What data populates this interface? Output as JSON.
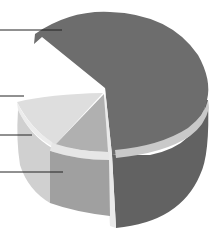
{
  "diagram": {
    "type": "3d-layered-cylinder-cutaway",
    "colors": {
      "background": "#ffffff",
      "dark_segment_top": "#6d6d6d",
      "dark_segment_side": "#626262",
      "band": "#c8c8c8",
      "light_top": "#dedede",
      "light_side": "#cfcfcf",
      "medium_segment": "#a9a9a9",
      "medium_side": "#9c9c9c",
      "leader_line": "#222222"
    },
    "leader_lines": [
      {
        "id": "leader-1",
        "y": 30,
        "x1": 0,
        "x2": 62
      },
      {
        "id": "leader-2",
        "y": 96,
        "x1": 0,
        "x2": 24
      },
      {
        "id": "leader-3",
        "y": 135,
        "x1": 0,
        "x2": 32
      },
      {
        "id": "leader-4",
        "y": 172,
        "x1": 0,
        "x2": 63
      }
    ]
  }
}
